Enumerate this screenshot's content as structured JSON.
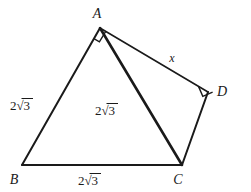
{
  "figure": {
    "type": "geometry-diagram",
    "background_color": "#ffffff",
    "line_color": "#1a1a1a",
    "vertices": [
      {
        "name": "A",
        "label": "A",
        "x": 100,
        "y": 28,
        "label_x": 97,
        "label_y": 18
      },
      {
        "name": "B",
        "label": "B",
        "x": 22,
        "y": 165,
        "label_x": 14,
        "label_y": 184
      },
      {
        "name": "C",
        "label": "C",
        "x": 182,
        "y": 165,
        "label_x": 178,
        "label_y": 184
      },
      {
        "name": "D",
        "label": "D",
        "x": 208,
        "y": 92,
        "label_x": 222,
        "label_y": 96
      }
    ],
    "edges": [
      {
        "name": "edge-AB",
        "from": "A",
        "to": "B",
        "weight": "med"
      },
      {
        "name": "edge-BC",
        "from": "B",
        "to": "C",
        "weight": "med"
      },
      {
        "name": "edge-AC",
        "from": "A",
        "to": "C",
        "weight": "thick"
      },
      {
        "name": "edge-AD",
        "from": "A",
        "to": "D",
        "weight": "thin"
      },
      {
        "name": "edge-DC",
        "from": "D",
        "to": "C",
        "weight": "med"
      }
    ],
    "right_angles": [
      {
        "name": "right-angle-A",
        "at": "A",
        "between": "BA and AC",
        "size": 11
      },
      {
        "name": "right-angle-D",
        "at": "D",
        "between": "AD and DC",
        "size": 11
      }
    ],
    "side_labels": [
      {
        "name": "label-AB",
        "edge": "AB",
        "coefficient": "2",
        "radicand": "3",
        "x": 20,
        "y": 110
      },
      {
        "name": "label-AC",
        "edge": "AC",
        "coefficient": "2",
        "radicand": "3",
        "x": 105,
        "y": 115
      },
      {
        "name": "label-BC",
        "edge": "BC",
        "coefficient": "2",
        "radicand": "3",
        "x": 88,
        "y": 185
      },
      {
        "name": "label-AD",
        "edge": "AD",
        "text": "x",
        "x": 172,
        "y": 62
      }
    ],
    "radical_glyph": "√",
    "unknown_label": "x"
  }
}
